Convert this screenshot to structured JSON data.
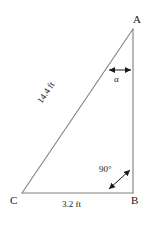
{
  "figure": {
    "type": "right-triangle-diagram",
    "background_color": "#ffffff",
    "stroke_color": "#808080",
    "text_color": "#1a1a1a",
    "vertices": {
      "A": {
        "label": "A",
        "x": 133,
        "y": 29
      },
      "B": {
        "label": "B",
        "x": 133,
        "y": 193
      },
      "C": {
        "label": "C",
        "x": 22,
        "y": 193
      }
    },
    "sides": {
      "hypotenuse": {
        "from": "C",
        "to": "A",
        "label": "14.4 ft",
        "value": 14.4,
        "unit": "ft"
      },
      "base": {
        "from": "C",
        "to": "B",
        "label": "3.2 ft",
        "value": 3.2,
        "unit": "ft"
      },
      "vertical": {
        "from": "A",
        "to": "B",
        "label": "",
        "value": null,
        "unit": "ft"
      }
    },
    "angles": {
      "alpha": {
        "label": "α",
        "at_vertex": "A",
        "annotation": "double-headed-arrow"
      },
      "right": {
        "label": "90°",
        "at_vertex": "B",
        "annotation": "double-headed-arrow"
      }
    }
  }
}
